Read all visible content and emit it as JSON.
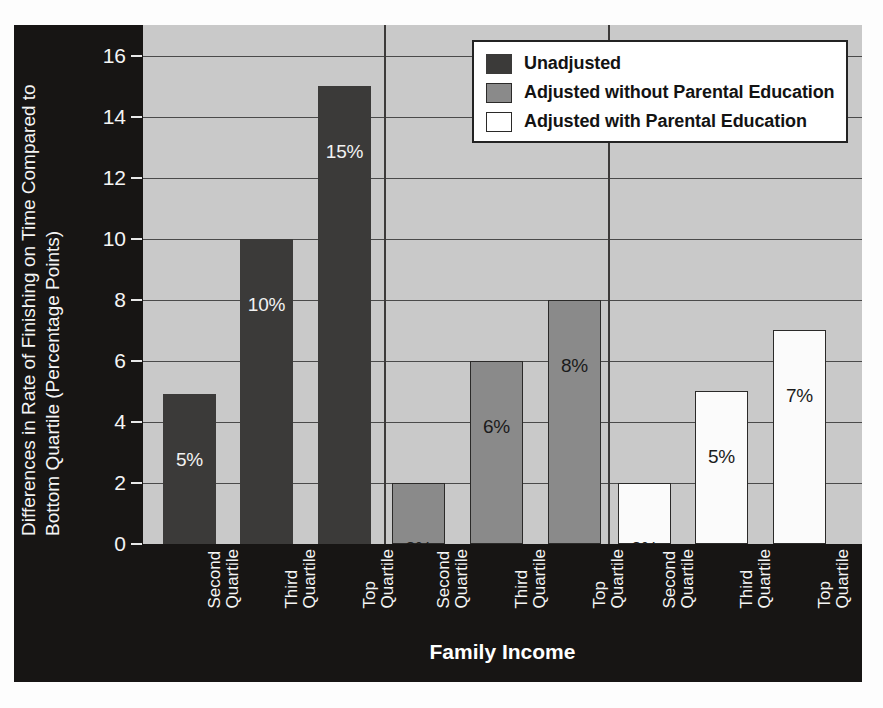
{
  "chart_data": {
    "type": "bar",
    "title": "",
    "xlabel": "Family Income",
    "ylabel_line1": "Differences in Rate of Finishing on Time Compared to",
    "ylabel_line2": "Bottom Quartile (Percentage Points)",
    "ylim": [
      0,
      17
    ],
    "yticks": [
      0,
      2,
      4,
      6,
      8,
      10,
      12,
      14,
      16
    ],
    "ytick_labels": [
      "0",
      "2",
      "4",
      "6",
      "8",
      "10",
      "12",
      "14",
      "16"
    ],
    "grid": true,
    "legend_position": "top-right",
    "groups": [
      {
        "name": "Unadjusted",
        "categories": [
          "Second Quartile",
          "Third Quartile",
          "Top Quartile"
        ],
        "values": [
          4.9,
          10,
          15
        ],
        "data_labels": [
          "5%",
          "10%",
          "15%"
        ],
        "color": "#3b3a39",
        "label_color": "light"
      },
      {
        "name": "Adjusted without Parental Education",
        "categories": [
          "Second Quartile",
          "Third Quartile",
          "Top Quartile"
        ],
        "values": [
          2,
          6,
          8
        ],
        "data_labels": [
          "2%",
          "6%",
          "8%"
        ],
        "color": "#8a8a8a",
        "label_color": "dark"
      },
      {
        "name": "Adjusted with Parental Education",
        "categories": [
          "Second Quartile",
          "Third Quartile",
          "Top Quartile"
        ],
        "values": [
          2,
          5,
          7
        ],
        "data_labels": [
          "2%",
          "5%",
          "7%"
        ],
        "color": "#ffffff",
        "label_color": "dark"
      }
    ],
    "categories": [
      "Second Quartile",
      "Third Quartile",
      "Top Quartile"
    ],
    "series": [
      {
        "name": "Unadjusted",
        "values": [
          4.9,
          10,
          15
        ]
      },
      {
        "name": "Adjusted without Parental Education",
        "values": [
          2,
          6,
          8
        ]
      },
      {
        "name": "Adjusted with Parental Education",
        "values": [
          2,
          5,
          7
        ]
      }
    ]
  },
  "legend": {
    "entries": [
      {
        "label": "Unadjusted"
      },
      {
        "label": "Adjusted without Parental Education"
      },
      {
        "label": "Adjusted with Parental Education"
      }
    ]
  },
  "xticks": [
    {
      "line1": "Second",
      "line2": "Quartile"
    },
    {
      "line1": "Third",
      "line2": "Quartile"
    },
    {
      "line1": "Top",
      "line2": "Quartile"
    },
    {
      "line1": "Second",
      "line2": "Quartile"
    },
    {
      "line1": "Third",
      "line2": "Quartile"
    },
    {
      "line1": "Top",
      "line2": "Quartile"
    },
    {
      "line1": "Second",
      "line2": "Quartile"
    },
    {
      "line1": "Third",
      "line2": "Quartile"
    },
    {
      "line1": "Top",
      "line2": "Quartile"
    }
  ],
  "colors": {
    "panel_background": "#171514",
    "plot_background": "#c9c9c9",
    "gridline": "#4a4a4a",
    "series1": "#3b3a39",
    "series2": "#8a8a8a",
    "series3": "#ffffff",
    "text_light": "#f5f5f5",
    "text_dark": "#131313"
  }
}
